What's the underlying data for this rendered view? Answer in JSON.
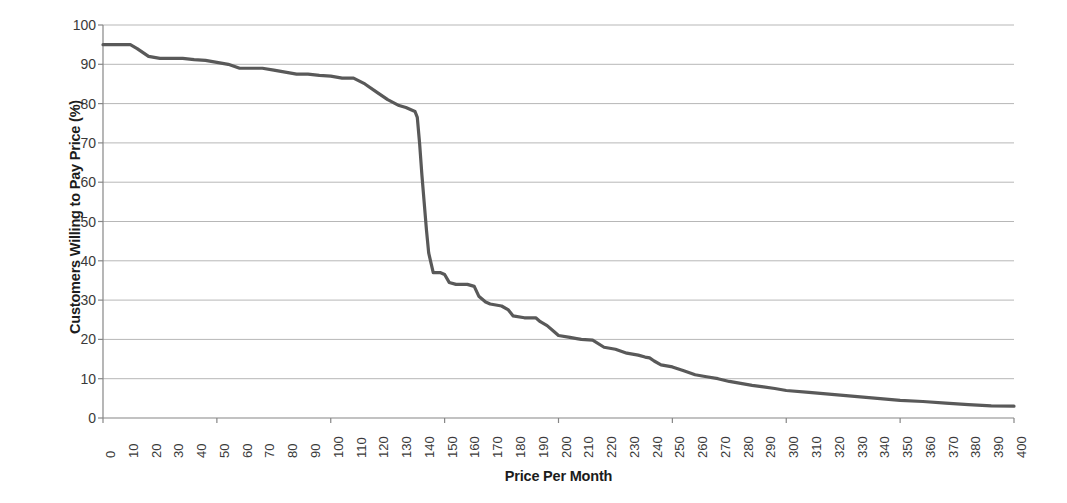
{
  "chart_data": {
    "type": "line",
    "title": "",
    "xlabel": "Price Per Month",
    "ylabel": "Customers Willing to Pay Price (%)",
    "xlim": [
      0,
      400
    ],
    "ylim": [
      0,
      100
    ],
    "xtick_step": 10,
    "ytick_step": 10,
    "grid": "horizontal",
    "legend": "none",
    "line_color": "#595959",
    "gridline_color": "#b7b7b7",
    "axis_color": "#868686",
    "xticks": [
      0,
      10,
      20,
      30,
      40,
      50,
      60,
      70,
      80,
      90,
      100,
      110,
      120,
      130,
      140,
      150,
      160,
      170,
      180,
      190,
      200,
      210,
      220,
      230,
      240,
      250,
      260,
      270,
      280,
      290,
      300,
      310,
      320,
      330,
      340,
      350,
      360,
      370,
      380,
      390,
      400
    ],
    "yticks": [
      0,
      10,
      20,
      30,
      40,
      50,
      60,
      70,
      80,
      90,
      100
    ],
    "series": [
      {
        "name": "Customers Willing to Pay Price",
        "x": [
          0,
          5,
          10,
          12,
          15,
          20,
          25,
          30,
          35,
          40,
          45,
          50,
          55,
          60,
          65,
          70,
          75,
          80,
          85,
          90,
          95,
          100,
          105,
          110,
          115,
          120,
          125,
          130,
          133,
          135,
          137,
          138,
          139,
          140,
          141,
          142,
          143,
          145,
          148,
          150,
          152,
          155,
          158,
          160,
          163,
          165,
          168,
          170,
          175,
          178,
          180,
          185,
          188,
          190,
          192,
          195,
          198,
          200,
          205,
          208,
          210,
          215,
          220,
          225,
          230,
          235,
          238,
          240,
          242,
          245,
          250,
          255,
          260,
          265,
          270,
          275,
          280,
          285,
          290,
          295,
          300,
          310,
          320,
          330,
          340,
          350,
          360,
          370,
          380,
          390,
          400
        ],
        "y": [
          95,
          95,
          95,
          95,
          94,
          92,
          91.5,
          91.5,
          91.5,
          91.2,
          91,
          90.5,
          90,
          89,
          89,
          89,
          88.5,
          88,
          87.5,
          87.5,
          87.2,
          87,
          86.5,
          86.5,
          85,
          83,
          81,
          79.5,
          79,
          78.5,
          78,
          76.5,
          70,
          62,
          55,
          48,
          42,
          37,
          37,
          36.5,
          34.5,
          34,
          34,
          34,
          33.5,
          31,
          29.5,
          29,
          28.5,
          27.5,
          26,
          25.5,
          25.5,
          25.5,
          24.5,
          23.5,
          22,
          21,
          20.5,
          20.2,
          20,
          19.8,
          18,
          17.5,
          16.5,
          16,
          15.5,
          15.3,
          14.5,
          13.5,
          13,
          12,
          11,
          10.5,
          10,
          9.3,
          8.8,
          8.3,
          7.9,
          7.5,
          7,
          6.5,
          6,
          5.5,
          5,
          4.5,
          4.2,
          3.8,
          3.4,
          3.1,
          3
        ]
      }
    ]
  }
}
